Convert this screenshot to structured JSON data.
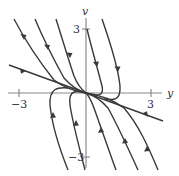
{
  "figure": {
    "type": "phase-portrait",
    "axes": {
      "x_label": "y",
      "y_label": "v",
      "x_ticks": [
        {
          "label": "−3",
          "value": -3
        },
        {
          "label": "3",
          "value": 3
        }
      ],
      "y_ticks": [
        {
          "label": "3",
          "value": 3
        },
        {
          "label": "−3",
          "value": -3
        }
      ]
    },
    "equilibrium": "origin (0, 0)",
    "straight_line_solution": "line through origin with negative slope",
    "colors": {
      "curve": "#3a3a3a",
      "axis": "#8a8a8a",
      "background": "#ffffff"
    }
  }
}
